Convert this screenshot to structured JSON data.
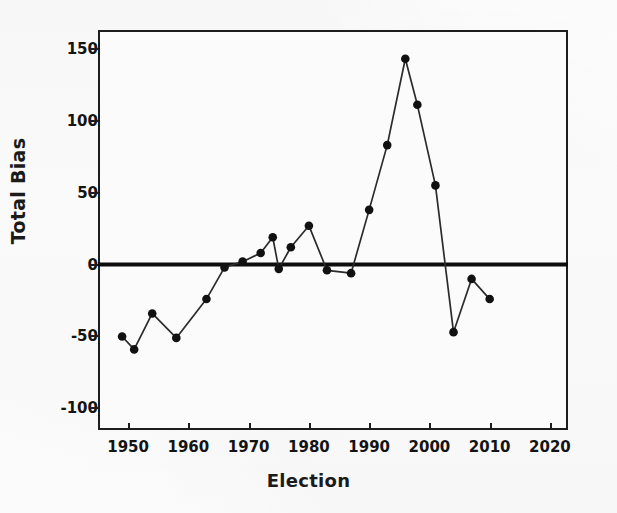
{
  "chart_data": {
    "type": "line",
    "title": "",
    "xlabel": "Election",
    "ylabel": "Total Bias",
    "xlim": [
      1945,
      2023
    ],
    "ylim": [
      -115,
      163
    ],
    "grid": false,
    "legend": "none",
    "marker": "filled-circle",
    "line_color": "#2b2b2b",
    "marker_color": "#111111",
    "zero_line": 0,
    "zero_line_color": "#0d0d0d",
    "x": [
      1949,
      1951,
      1954,
      1958,
      1963,
      1966,
      1969,
      1972,
      1974,
      1975,
      1977,
      1980,
      1983,
      1987,
      1990,
      1993,
      1996,
      1998,
      2001,
      2004,
      2007,
      2010,
      2013,
      2016,
      2019
    ],
    "values": [
      -50,
      -59,
      -34,
      -51,
      -24,
      -2,
      2,
      8,
      19,
      -3,
      12,
      27,
      -4,
      -4,
      -6,
      38,
      83,
      143,
      111,
      55,
      -47,
      -10,
      -24,
      null,
      null
    ],
    "points": [
      {
        "x": 1949,
        "y": -50
      },
      {
        "x": 1951,
        "y": -59
      },
      {
        "x": 1954,
        "y": -34
      },
      {
        "x": 1958,
        "y": -51
      },
      {
        "x": 1963,
        "y": -24
      },
      {
        "x": 1966,
        "y": -2
      },
      {
        "x": 1969,
        "y": 2
      },
      {
        "x": 1972,
        "y": 8
      },
      {
        "x": 1974,
        "y": 19
      },
      {
        "x": 1975,
        "y": -3
      },
      {
        "x": 1977,
        "y": 12
      },
      {
        "x": 1980,
        "y": 27
      },
      {
        "x": 1983,
        "y": -4
      },
      {
        "x": 1987,
        "y": -6
      },
      {
        "x": 1990,
        "y": 38
      },
      {
        "x": 1993,
        "y": 83
      },
      {
        "x": 1996,
        "y": 143
      },
      {
        "x": 1998,
        "y": 111
      },
      {
        "x": 2001,
        "y": 55
      },
      {
        "x": 2004,
        "y": -47
      },
      {
        "x": 2007,
        "y": -10
      },
      {
        "x": 2010,
        "y": -24
      }
    ],
    "yticks": [
      150,
      100,
      50,
      0,
      -50,
      -100
    ],
    "ytick_labels": [
      "150",
      "100",
      "50",
      "0",
      "-50",
      "-100"
    ],
    "xticks": [
      1950,
      1960,
      1970,
      1980,
      1990,
      2000,
      2010,
      2020
    ],
    "xtick_labels": [
      "1950",
      "1960",
      "1970",
      "1980",
      "1990",
      "2000",
      "2010",
      "2020"
    ]
  },
  "axes": {
    "y_title": "Total Bias",
    "x_title": "Election"
  },
  "colors": {
    "frame": "#1d1d1d",
    "ink": "#141414",
    "plot_background": "#fbfbfb",
    "page_background": "#fdfdfd"
  }
}
